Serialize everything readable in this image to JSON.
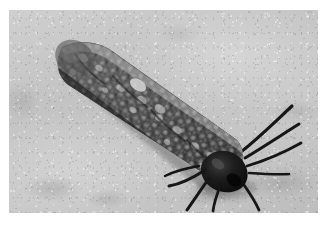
{
  "image": {
    "kind": "photograph",
    "subject": "insect-larva",
    "subject_description": "Bagworm / caterpillar larva in a granular case resting on a concrete surface",
    "color_mode": "grayscale",
    "orientation": "landscape",
    "width_px": 327,
    "height_px": 226,
    "border": {
      "present": true,
      "color": "#ffffff",
      "left_px": 9,
      "top_px": 10,
      "right_px": 9,
      "bottom_px": 13
    },
    "photo_area": {
      "x": 9,
      "y": 10,
      "width": 309,
      "height": 203
    }
  },
  "scene": {
    "background": {
      "name": "concrete-ground",
      "description": "Light gray mottled sandy concrete with fine grain speckle",
      "colors": {
        "lightest": "#dedede",
        "light": "#d2d2d2",
        "mid": "#c4c4c4",
        "dark": "#b4b4b4",
        "darkest": "#9c9c9c"
      }
    },
    "subject": {
      "name": "larva",
      "common_name": "bagworm larva",
      "pose": "diagonal, head toward lower-right",
      "body": {
        "name": "larval-case-body",
        "description": "Elongated tapering tube covered in pebbly granules",
        "angle_deg": 34,
        "length_px": 185,
        "max_width_px": 46,
        "head_end": "lower-right",
        "tail_end": "upper-left",
        "colors": {
          "base": "#4a4a4a",
          "granule_light": "#9a9a9a",
          "granule_mid": "#6e6e6e",
          "shadow": "#2b2b2b",
          "highlight": "#c8c8c8"
        }
      },
      "head": {
        "name": "head-capsule",
        "description": "Dark glossy black head capsule at the lower-right end",
        "color": "#161616",
        "center_px": [
          221,
          158
        ]
      },
      "appendages": {
        "name": "legs-and-antennae",
        "description": "Six to eight long, thin, dark, slightly curved legs and antennae radiating from the head",
        "count": 8,
        "color": "#1a1a1a",
        "directions": [
          "upper-right",
          "right",
          "lower-right",
          "lower-left",
          "left"
        ]
      },
      "cast_shadow": {
        "name": "cast-shadow",
        "description": "Soft gray shadow beneath the lower-left edge of the body",
        "color": "rgba(60,60,60,0.40)"
      }
    }
  }
}
